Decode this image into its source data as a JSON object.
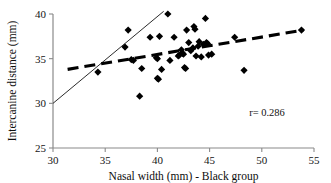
{
  "chart_data": {
    "type": "scatter",
    "title": "",
    "xlabel": "Nasal width (mm) - Black group",
    "ylabel": "Intercanine distance (mm)",
    "xlim": [
      30,
      55
    ],
    "ylim": [
      25,
      40
    ],
    "xticks": [
      30,
      35,
      40,
      45,
      50,
      55
    ],
    "yticks": [
      25,
      30,
      35,
      40
    ],
    "xtick_labels": [
      "30",
      "35",
      "40",
      "45",
      "50",
      "55"
    ],
    "ytick_labels": [
      "25",
      "30",
      "35",
      "40"
    ],
    "grid": false,
    "legend": false,
    "annotations": [
      {
        "name": "correlation-annotation",
        "text": "r= 0.286",
        "x": 50.5,
        "y": 28.6
      }
    ],
    "series": [
      {
        "name": "observations",
        "marker": "diamond",
        "color": "#000000",
        "points": [
          [
            34.3,
            33.5
          ],
          [
            36.9,
            36.3
          ],
          [
            37.2,
            38.2
          ],
          [
            37.5,
            34.9
          ],
          [
            37.7,
            34.8
          ],
          [
            38.3,
            30.8
          ],
          [
            38.5,
            33.9
          ],
          [
            39.3,
            37.4
          ],
          [
            39.9,
            35.1
          ],
          [
            40.0,
            35.0
          ],
          [
            40.0,
            32.8
          ],
          [
            40.1,
            32.7
          ],
          [
            40.2,
            37.5
          ],
          [
            40.4,
            33.8
          ],
          [
            41.0,
            40.0
          ],
          [
            41.2,
            34.8
          ],
          [
            41.6,
            37.4
          ],
          [
            42.0,
            35.3
          ],
          [
            42.1,
            35.4
          ],
          [
            42.3,
            36.0
          ],
          [
            42.4,
            35.6
          ],
          [
            42.5,
            35.5
          ],
          [
            42.6,
            34.0
          ],
          [
            42.7,
            33.9
          ],
          [
            42.8,
            38.2
          ],
          [
            43.0,
            36.8
          ],
          [
            43.2,
            35.9
          ],
          [
            43.4,
            36.2
          ],
          [
            43.5,
            38.6
          ],
          [
            43.6,
            38.3
          ],
          [
            43.7,
            35.3
          ],
          [
            43.9,
            36.4
          ],
          [
            44.0,
            36.9
          ],
          [
            44.2,
            35.2
          ],
          [
            44.4,
            36.6
          ],
          [
            44.6,
            39.5
          ],
          [
            44.7,
            36.8
          ],
          [
            44.8,
            36.7
          ],
          [
            44.9,
            35.4
          ],
          [
            45.2,
            35.5
          ],
          [
            47.4,
            37.4
          ],
          [
            48.3,
            33.7
          ],
          [
            53.8,
            38.2
          ]
        ]
      }
    ],
    "fit_lines": [
      {
        "name": "identity-reference-line",
        "style": "solid",
        "x_start": 30.0,
        "y_start": 30.0,
        "x_end": 40.6,
        "y_end": 40.3
      },
      {
        "name": "regression-line",
        "style": "dashed",
        "x_start": 31.4,
        "y_start": 33.8,
        "x_end": 54.0,
        "y_end": 38.2
      }
    ]
  }
}
